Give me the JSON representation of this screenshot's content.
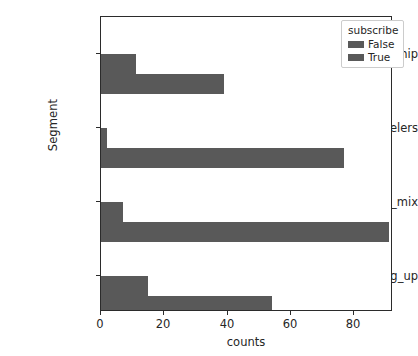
{
  "chart_data": {
    "type": "bar",
    "orientation": "horizontal",
    "title": "",
    "xlabel": "counts",
    "ylabel": "Segment",
    "categories": [
      "urban_hip",
      "travelers",
      "suburb_mix",
      "moving_up"
    ],
    "series": [
      {
        "name": "False",
        "values": [
          11,
          2,
          7,
          15
        ]
      },
      {
        "name": "True",
        "values": [
          39,
          77,
          91,
          54
        ]
      }
    ],
    "legend": {
      "title": "subscribe",
      "position": "upper right",
      "entries": [
        "False",
        "True"
      ]
    },
    "xlim": [
      0,
      92.4
    ],
    "xticks": [
      0,
      20,
      40,
      60,
      80
    ],
    "xtick_labels": [
      "0",
      "20",
      "40",
      "60",
      "80"
    ],
    "grid": false,
    "bar_color": "#595959",
    "axis_color": "#2b2b2b",
    "text_color": "#262626",
    "background": "#ffffff"
  }
}
